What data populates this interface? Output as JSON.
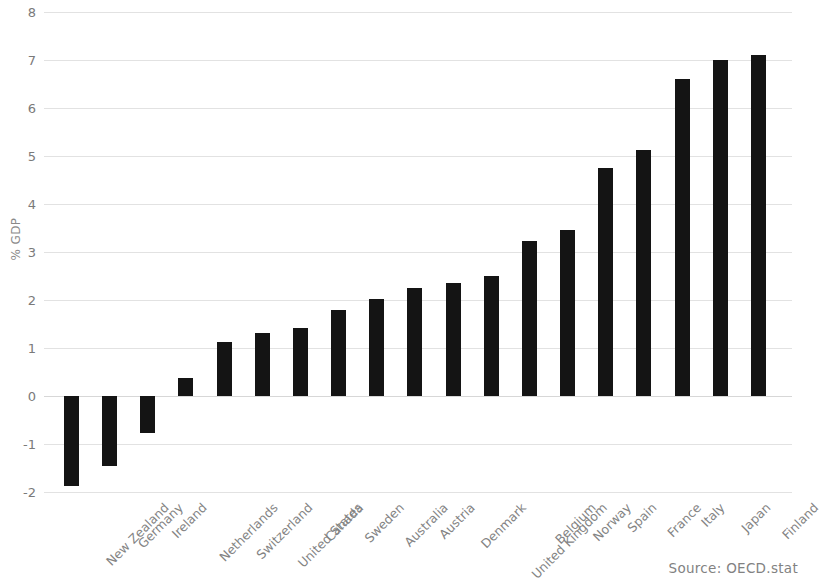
{
  "chart_data": {
    "type": "bar",
    "title": "",
    "xlabel": "",
    "ylabel": "% GDP",
    "ylim": [
      -2,
      8
    ],
    "yticks": [
      -2,
      -1,
      0,
      1,
      2,
      3,
      4,
      5,
      6,
      7,
      8
    ],
    "ytick_labels": [
      "-2",
      "-1",
      "0",
      "1",
      "2",
      "3",
      "4",
      "5",
      "6",
      "7",
      "8"
    ],
    "grid": true,
    "legend": null,
    "bar_color": "#141414",
    "grid_color": "#e2e2e2",
    "categories": [
      "New Zealand",
      "Germany",
      "Ireland",
      "Netherlands",
      "Switzerland",
      "United States",
      "Canada",
      "Sweden",
      "Australia",
      "Austria",
      "Denmark",
      "United Kingdom",
      "Belgium",
      "Norway",
      "Spain",
      "France",
      "Italy",
      "Japan",
      "Finland"
    ],
    "values": [
      -1.88,
      -1.45,
      -0.78,
      0.37,
      1.12,
      1.31,
      1.41,
      1.79,
      2.03,
      2.25,
      2.36,
      2.5,
      3.22,
      3.45,
      4.75,
      5.12,
      6.6,
      7.0,
      7.1
    ]
  },
  "source_note": "Source: OECD.stat"
}
